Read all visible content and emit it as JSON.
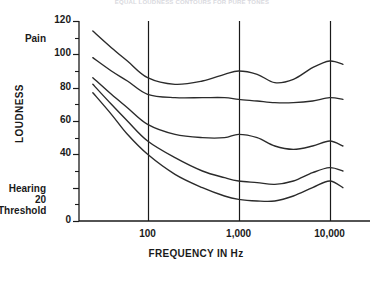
{
  "chart_data": {
    "type": "line",
    "title": "EQUAL LOUDNESS CONTOURS FOR PURE TONES",
    "xlabel": "FREQUENCY IN Hz",
    "ylabel": "LOUDNESS",
    "xscale": "log",
    "xlim": [
      20,
      20000
    ],
    "ylim": [
      0,
      120
    ],
    "grid": "vertical-major-only",
    "legend": "none",
    "xticks": [
      {
        "value": 100,
        "label": "100"
      },
      {
        "value": 1000,
        "label": "1,000"
      },
      {
        "value": 10000,
        "label": "10,000"
      }
    ],
    "yticks": [
      {
        "value": 0,
        "label": "0"
      },
      {
        "value": 20,
        "label": "20"
      },
      {
        "value": 40,
        "label": "40"
      },
      {
        "value": 60,
        "label": "60"
      },
      {
        "value": 80,
        "label": "80"
      },
      {
        "value": 100,
        "label": "100"
      },
      {
        "value": 120,
        "label": "120"
      }
    ],
    "yminorticks": [
      10,
      30,
      50,
      70,
      90,
      110
    ],
    "annotations": [
      {
        "name": "pain",
        "text": "Pain",
        "y_value": 110
      },
      {
        "name": "hearing-threshold",
        "text": "Hearing 20\nThreshold",
        "y_value": 20
      }
    ],
    "series": [
      {
        "name": "contour-110-phon",
        "points": [
          {
            "x": 25,
            "y": 114
          },
          {
            "x": 40,
            "y": 104
          },
          {
            "x": 60,
            "y": 96
          },
          {
            "x": 100,
            "y": 86
          },
          {
            "x": 200,
            "y": 82
          },
          {
            "x": 400,
            "y": 84
          },
          {
            "x": 700,
            "y": 88
          },
          {
            "x": 1000,
            "y": 90
          },
          {
            "x": 1600,
            "y": 88
          },
          {
            "x": 2500,
            "y": 83
          },
          {
            "x": 4000,
            "y": 85
          },
          {
            "x": 6500,
            "y": 92
          },
          {
            "x": 10000,
            "y": 96
          },
          {
            "x": 14000,
            "y": 94
          }
        ]
      },
      {
        "name": "contour-90-phon",
        "points": [
          {
            "x": 25,
            "y": 98
          },
          {
            "x": 40,
            "y": 90
          },
          {
            "x": 60,
            "y": 84
          },
          {
            "x": 100,
            "y": 76
          },
          {
            "x": 200,
            "y": 74
          },
          {
            "x": 400,
            "y": 74
          },
          {
            "x": 700,
            "y": 74
          },
          {
            "x": 1000,
            "y": 73
          },
          {
            "x": 1600,
            "y": 72
          },
          {
            "x": 2500,
            "y": 71
          },
          {
            "x": 4000,
            "y": 71
          },
          {
            "x": 6500,
            "y": 72
          },
          {
            "x": 10000,
            "y": 74
          },
          {
            "x": 14000,
            "y": 73
          }
        ]
      },
      {
        "name": "contour-60-phon",
        "points": [
          {
            "x": 25,
            "y": 86
          },
          {
            "x": 40,
            "y": 76
          },
          {
            "x": 60,
            "y": 68
          },
          {
            "x": 100,
            "y": 58
          },
          {
            "x": 200,
            "y": 52
          },
          {
            "x": 400,
            "y": 50
          },
          {
            "x": 700,
            "y": 50
          },
          {
            "x": 1000,
            "y": 52
          },
          {
            "x": 1600,
            "y": 50
          },
          {
            "x": 2500,
            "y": 45
          },
          {
            "x": 4000,
            "y": 43
          },
          {
            "x": 6500,
            "y": 45
          },
          {
            "x": 10000,
            "y": 48
          },
          {
            "x": 14000,
            "y": 45
          }
        ]
      },
      {
        "name": "contour-40-phon",
        "points": [
          {
            "x": 25,
            "y": 82
          },
          {
            "x": 40,
            "y": 70
          },
          {
            "x": 60,
            "y": 60
          },
          {
            "x": 100,
            "y": 48
          },
          {
            "x": 200,
            "y": 38
          },
          {
            "x": 400,
            "y": 30
          },
          {
            "x": 700,
            "y": 26
          },
          {
            "x": 1000,
            "y": 24
          },
          {
            "x": 1600,
            "y": 23
          },
          {
            "x": 2500,
            "y": 22
          },
          {
            "x": 4000,
            "y": 24
          },
          {
            "x": 6500,
            "y": 29
          },
          {
            "x": 10000,
            "y": 32
          },
          {
            "x": 14000,
            "y": 30
          }
        ]
      },
      {
        "name": "contour-20-phon",
        "points": [
          {
            "x": 25,
            "y": 77
          },
          {
            "x": 40,
            "y": 64
          },
          {
            "x": 60,
            "y": 52
          },
          {
            "x": 100,
            "y": 40
          },
          {
            "x": 200,
            "y": 28
          },
          {
            "x": 400,
            "y": 20
          },
          {
            "x": 700,
            "y": 15
          },
          {
            "x": 1000,
            "y": 13
          },
          {
            "x": 1600,
            "y": 12
          },
          {
            "x": 2500,
            "y": 12
          },
          {
            "x": 4000,
            "y": 15
          },
          {
            "x": 6500,
            "y": 20
          },
          {
            "x": 10000,
            "y": 24
          },
          {
            "x": 14000,
            "y": 20
          }
        ]
      }
    ]
  },
  "geometry": {
    "plot_left": 79,
    "plot_right": 370,
    "plot_top": 21,
    "plot_bottom": 221,
    "data_x_start": 84,
    "data_x_end": 357,
    "log_x_min": 20,
    "log_x_max": 20000
  },
  "style": {
    "line_color": "#2b2b2b",
    "axis_color": "#1a1a1a",
    "background": "#ffffff",
    "title_color": "#d9d9de"
  }
}
